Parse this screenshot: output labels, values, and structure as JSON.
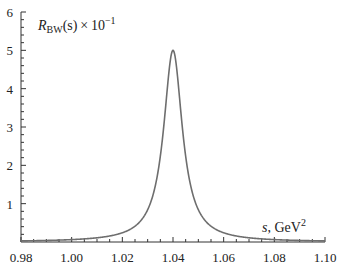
{
  "chart_data": {
    "type": "line",
    "title": "",
    "xlabel": "s, GeV²",
    "ylabel": "R_BW(s) × 10⁻¹",
    "xlim": [
      0.98,
      1.1
    ],
    "ylim": [
      0,
      6
    ],
    "grid": false,
    "legend": null,
    "x_ticks": [
      0.98,
      1.0,
      1.02,
      1.04,
      1.06,
      1.08,
      1.1
    ],
    "x_tick_labels": [
      "0.98",
      "1.00",
      "1.02",
      "1.04",
      "1.06",
      "1.08",
      "1.10"
    ],
    "y_ticks": [
      1,
      2,
      3,
      4,
      5,
      6
    ],
    "y_tick_labels": [
      "1",
      "2",
      "3",
      "4",
      "5",
      "6"
    ],
    "series": [
      {
        "name": "R_BW(s)",
        "color": "#6e6e6e",
        "x": [
          0.98,
          0.99,
          1.0,
          1.01,
          1.02,
          1.025,
          1.03,
          1.033,
          1.035,
          1.037,
          1.038,
          1.039,
          1.04,
          1.041,
          1.042,
          1.043,
          1.045,
          1.047,
          1.05,
          1.055,
          1.06,
          1.07,
          1.08,
          1.09,
          1.1
        ],
        "values": [
          0.03,
          0.05,
          0.06,
          0.11,
          0.24,
          0.41,
          0.84,
          1.46,
          2.24,
          3.46,
          4.17,
          4.77,
          5.0,
          4.77,
          4.17,
          3.46,
          2.24,
          1.46,
          0.84,
          0.41,
          0.24,
          0.11,
          0.06,
          0.04,
          0.03
        ]
      }
    ],
    "annotations": [
      {
        "text": "R_BW(s) × 10⁻¹",
        "position": "top-left inside axes"
      },
      {
        "text": "s, GeV²",
        "position": "bottom-right above x-axis"
      }
    ]
  },
  "labels": {
    "ylabel_R": "R",
    "ylabel_sub": "BW",
    "ylabel_rest": "(s) × 10",
    "ylabel_exp": "−1",
    "xlabel_s": "s",
    "xlabel_rest": ", GeV",
    "xlabel_exp": "2"
  }
}
